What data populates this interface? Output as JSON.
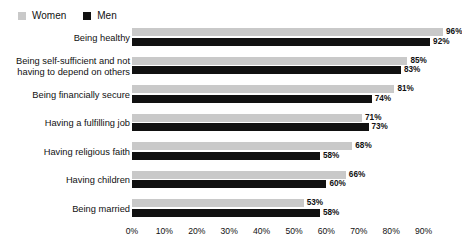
{
  "legend": {
    "entries": [
      {
        "label": "Women",
        "color": "#c9c9c9",
        "icon": "square-swatch-icon"
      },
      {
        "label": "Men",
        "color": "#111111",
        "icon": "square-swatch-icon"
      }
    ]
  },
  "chart_data": {
    "type": "bar",
    "orientation": "horizontal",
    "title": "",
    "xlabel": "",
    "ylabel": "",
    "xlim": [
      0,
      100
    ],
    "grid": true,
    "legend_position": "top-left",
    "value_suffix": "%",
    "categories": [
      "Being healthy",
      "Being self-sufficient and not having to depend on others",
      "Being financially secure",
      "Having a fulfilling job",
      "Having religious faith",
      "Having children",
      "Being married"
    ],
    "category_lines": [
      [
        "Being healthy"
      ],
      [
        "Being self-sufficient and not",
        "having to depend on others"
      ],
      [
        "Being financially secure"
      ],
      [
        "Having a fulfilling job"
      ],
      [
        "Having religious faith"
      ],
      [
        "Having children"
      ],
      [
        "Being married"
      ]
    ],
    "series": [
      {
        "name": "Women",
        "color": "#c9c9c9",
        "values": [
          96,
          85,
          81,
          71,
          68,
          66,
          53
        ],
        "labels": [
          "96%",
          "85%",
          "81%",
          "71%",
          "68%",
          "66%",
          "53%"
        ]
      },
      {
        "name": "Men",
        "color": "#111111",
        "values": [
          92,
          83,
          74,
          73,
          58,
          60,
          58
        ],
        "labels": [
          "92%",
          "83%",
          "74%",
          "73%",
          "58%",
          "60%",
          "58%"
        ]
      }
    ],
    "xticks": [
      0,
      10,
      20,
      30,
      40,
      50,
      60,
      70,
      80,
      90
    ],
    "xticklabels": [
      "0%",
      "10%",
      "20%",
      "30%",
      "40%",
      "50%",
      "60%",
      "70%",
      "80%",
      "90%"
    ]
  }
}
